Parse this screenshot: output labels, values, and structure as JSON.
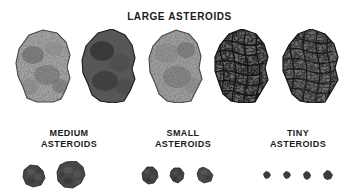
{
  "page": {
    "background_color": "#ffffff",
    "width": 359,
    "height": 196
  },
  "title": {
    "text": "LARGE ASTEROIDS"
  },
  "groups": [
    {
      "id": "large",
      "label": "LARGE ASTEROIDS",
      "count": 5,
      "sprites": [
        {
          "name": "large-asteroid-1",
          "tone": "#6e6e6e",
          "texture": "mottled",
          "x": 13,
          "y": 29,
          "w": 62,
          "h": 74
        },
        {
          "name": "large-asteroid-2",
          "tone": "#3a3a3a",
          "texture": "grainy",
          "x": 80,
          "y": 29,
          "w": 58,
          "h": 74
        },
        {
          "name": "large-asteroid-3",
          "tone": "#6a6a6a",
          "texture": "mottled",
          "x": 146,
          "y": 29,
          "w": 58,
          "h": 74
        },
        {
          "name": "large-asteroid-4",
          "tone": "#2b2b2b",
          "texture": "webbed",
          "x": 212,
          "y": 29,
          "w": 58,
          "h": 74
        },
        {
          "name": "large-asteroid-5",
          "tone": "#2e2e2e",
          "texture": "webbed",
          "x": 280,
          "y": 29,
          "w": 60,
          "h": 74
        }
      ]
    },
    {
      "id": "medium",
      "label": "MEDIUM\nASTEROIDS",
      "count": 2,
      "sprites": [
        {
          "name": "medium-asteroid-1",
          "tone": "#434343",
          "texture": "cratered",
          "x": 22,
          "y": 164,
          "w": 24,
          "h": 24
        },
        {
          "name": "medium-asteroid-2",
          "tone": "#454545",
          "texture": "cratered",
          "x": 56,
          "y": 161,
          "w": 30,
          "h": 28
        }
      ]
    },
    {
      "id": "small",
      "label": "SMALL\nASTEROIDS",
      "count": 3,
      "sprites": [
        {
          "name": "small-asteroid-1",
          "tone": "#3e3e3e",
          "texture": "cratered",
          "x": 141,
          "y": 166,
          "w": 18,
          "h": 19
        },
        {
          "name": "small-asteroid-2",
          "tone": "#3f3f3f",
          "texture": "cratered",
          "x": 169,
          "y": 167,
          "w": 16,
          "h": 17
        },
        {
          "name": "small-asteroid-3",
          "tone": "#444444",
          "texture": "cratered",
          "x": 196,
          "y": 167,
          "w": 18,
          "h": 17
        }
      ]
    },
    {
      "id": "tiny",
      "label": "TINY\nASTEROIDS",
      "count": 4,
      "sprites": [
        {
          "name": "tiny-asteroid-1",
          "tone": "#3b3b3b",
          "texture": "solid",
          "x": 263,
          "y": 171,
          "w": 8,
          "h": 8
        },
        {
          "name": "tiny-asteroid-2",
          "tone": "#3b3b3b",
          "texture": "solid",
          "x": 283,
          "y": 171,
          "w": 8,
          "h": 8
        },
        {
          "name": "tiny-asteroid-3",
          "tone": "#3b3b3b",
          "texture": "solid",
          "x": 303,
          "y": 171,
          "w": 8,
          "h": 9
        },
        {
          "name": "tiny-asteroid-4",
          "tone": "#3b3b3b",
          "texture": "solid",
          "x": 323,
          "y": 170,
          "w": 10,
          "h": 10
        }
      ]
    }
  ],
  "labels": {
    "medium": "MEDIUM\nASTEROIDS",
    "small": "SMALL\nASTEROIDS",
    "tiny": "TINY\nASTEROIDS"
  }
}
